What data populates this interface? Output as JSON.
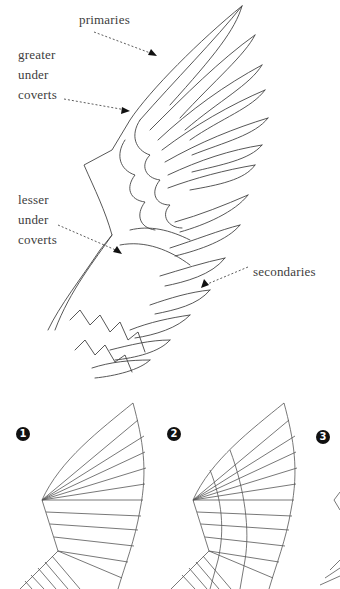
{
  "labels": {
    "primaries": "primaries",
    "greater_1": "greater",
    "greater_2": "under",
    "greater_3": "coverts",
    "lesser_1": "lesser",
    "lesser_2": "under",
    "lesser_3": "coverts",
    "secondaries": "secondaries"
  },
  "steps": [
    "1",
    "2",
    "3"
  ],
  "colors": {
    "ink": "#3a3a3a",
    "badge": "#111111"
  }
}
